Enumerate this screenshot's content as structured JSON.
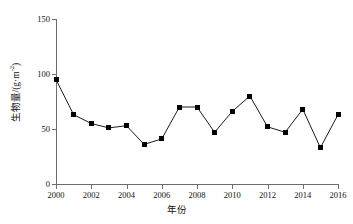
{
  "chart_data": {
    "type": "line",
    "title": "",
    "subtitle": "",
    "xlabel": "年份",
    "ylabel": "生物量/(g·m⁻²)",
    "ylabel_main": "生物量/(g·m",
    "ylabel_exponent": "-2",
    "ylabel_tail": ")",
    "x": [
      2000,
      2001,
      2002,
      2003,
      2004,
      2005,
      2006,
      2007,
      2008,
      2009,
      2010,
      2011,
      2012,
      2013,
      2014,
      2015,
      2016
    ],
    "values": [
      95,
      63,
      55,
      51,
      53,
      36,
      41,
      70,
      70,
      47,
      66,
      80,
      52,
      47,
      68,
      33,
      63
    ],
    "series": [
      {
        "name": "生物量",
        "values": [
          95,
          63,
          55,
          51,
          53,
          36,
          41,
          70,
          70,
          47,
          66,
          80,
          52,
          47,
          68,
          33,
          63
        ]
      }
    ],
    "xlim": [
      2000,
      2016
    ],
    "ylim": [
      0,
      150
    ],
    "yticks": [
      0,
      50,
      100,
      150
    ],
    "ytick_labels": [
      "0",
      "50",
      "100",
      "150"
    ],
    "xticks": [
      2000,
      2002,
      2004,
      2006,
      2008,
      2010,
      2012,
      2014,
      2016
    ],
    "xtick_labels": [
      "2000",
      "2002",
      "2004",
      "2006",
      "2008",
      "2010",
      "2012",
      "2014",
      "2016"
    ],
    "grid": false,
    "legend": false,
    "legend_position": "none",
    "marker": "square",
    "marker_color": "#000000",
    "line_color": "#000000",
    "axis_color": "#6d6d6d",
    "background": "#ffffff"
  }
}
